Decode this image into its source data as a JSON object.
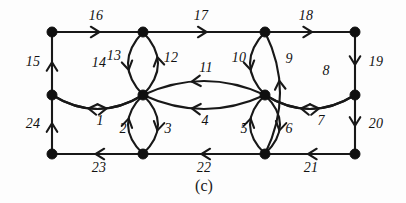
{
  "figure": {
    "caption": "(c)",
    "caption_pos": {
      "x": 204,
      "y": 186
    },
    "background_color": "#fdfdfd",
    "ink_color": "#181818"
  },
  "graph": {
    "type": "directed-multigraph",
    "node_radius": 5,
    "nodes": [
      {
        "id": "TL",
        "name": "top-left",
        "x": 52,
        "y": 32
      },
      {
        "id": "TA",
        "name": "top-inner-left",
        "x": 143,
        "y": 32
      },
      {
        "id": "TB",
        "name": "top-inner-right",
        "x": 265,
        "y": 32
      },
      {
        "id": "TR",
        "name": "top-right",
        "x": 355,
        "y": 32
      },
      {
        "id": "ML",
        "name": "mid-left",
        "x": 52,
        "y": 95
      },
      {
        "id": "MA",
        "name": "mid-inner-left",
        "x": 143,
        "y": 95
      },
      {
        "id": "MB",
        "name": "mid-inner-right",
        "x": 265,
        "y": 95
      },
      {
        "id": "MR",
        "name": "mid-right",
        "x": 355,
        "y": 95
      },
      {
        "id": "BL",
        "name": "bottom-left",
        "x": 52,
        "y": 154
      },
      {
        "id": "BA",
        "name": "bottom-inner-left",
        "x": 143,
        "y": 154
      },
      {
        "id": "BB",
        "name": "bottom-inner-right",
        "x": 265,
        "y": 154
      },
      {
        "id": "BR",
        "name": "bottom-right",
        "x": 355,
        "y": 154
      }
    ],
    "edges": [
      {
        "label": "1",
        "from": "ML",
        "to": "MA",
        "shape": "arc",
        "bow": 14,
        "label_x": 100,
        "label_y": 121
      },
      {
        "label": "2",
        "from": "MA",
        "to": "BA",
        "shape": "arc",
        "bow": -15,
        "label_x": 123,
        "label_y": 129
      },
      {
        "label": "3",
        "from": "BA",
        "to": "MA",
        "shape": "arc",
        "bow": -15,
        "label_x": 168,
        "label_y": 129
      },
      {
        "label": "4",
        "from": "MB",
        "to": "MA",
        "shape": "arc",
        "bow": 14,
        "label_x": 205,
        "label_y": 121
      },
      {
        "label": "5",
        "from": "MB",
        "to": "BB",
        "shape": "arc",
        "bow": -15,
        "label_x": 244,
        "label_y": 129
      },
      {
        "label": "6",
        "from": "BB",
        "to": "MB",
        "shape": "arc",
        "bow": -15,
        "label_x": 289,
        "label_y": 129
      },
      {
        "label": "7",
        "from": "MB",
        "to": "MR",
        "shape": "arc",
        "bow": 14,
        "label_x": 321,
        "label_y": 121
      },
      {
        "label": "8",
        "from": "MR",
        "to": "MB",
        "shape": "arc",
        "bow": -14,
        "label_x": 326,
        "label_y": 71
      },
      {
        "label": "9",
        "from": "BB",
        "to": "TB",
        "shape": "arc",
        "bow": 15,
        "label_x": 289,
        "label_y": 59
      },
      {
        "label": "10",
        "from": "TB",
        "to": "MB",
        "shape": "arc",
        "bow": 15,
        "label_x": 239,
        "label_y": 58
      },
      {
        "label": "11",
        "from": "MB",
        "to": "MA",
        "shape": "arc",
        "bow": -14,
        "label_x": 206,
        "label_y": 68
      },
      {
        "label": "12",
        "from": "MA",
        "to": "TA",
        "shape": "arc",
        "bow": 15,
        "label_x": 171,
        "label_y": 58
      },
      {
        "label": "13",
        "from": "TA",
        "to": "MA",
        "shape": "arc",
        "bow": 15,
        "label_x": 114,
        "label_y": 56
      },
      {
        "label": "14",
        "from": "MA",
        "to": "ML",
        "shape": "arc",
        "bow": -14,
        "label_x": 99,
        "label_y": 63
      },
      {
        "label": "15",
        "from": "ML",
        "to": "TL",
        "shape": "line",
        "label_x": 33,
        "label_y": 62
      },
      {
        "label": "16",
        "from": "TL",
        "to": "TA",
        "shape": "line",
        "label_x": 96,
        "label_y": 16
      },
      {
        "label": "17",
        "from": "TA",
        "to": "TB",
        "shape": "line",
        "label_x": 201,
        "label_y": 16
      },
      {
        "label": "18",
        "from": "TB",
        "to": "TR",
        "shape": "line",
        "label_x": 306,
        "label_y": 16
      },
      {
        "label": "19",
        "from": "TR",
        "to": "MR",
        "shape": "line",
        "label_x": 376,
        "label_y": 62
      },
      {
        "label": "20",
        "from": "MR",
        "to": "BR",
        "shape": "line",
        "label_x": 376,
        "label_y": 124
      },
      {
        "label": "21",
        "from": "BR",
        "to": "BB",
        "shape": "line",
        "label_x": 311,
        "label_y": 168
      },
      {
        "label": "22",
        "from": "BB",
        "to": "BA",
        "shape": "line",
        "label_x": 204,
        "label_y": 168
      },
      {
        "label": "23",
        "from": "BA",
        "to": "BL",
        "shape": "line",
        "label_x": 99,
        "label_y": 168
      },
      {
        "label": "24",
        "from": "BL",
        "to": "ML",
        "shape": "line",
        "label_x": 33,
        "label_y": 124
      }
    ]
  }
}
